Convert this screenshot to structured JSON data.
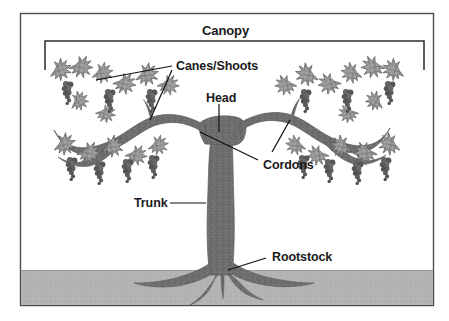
{
  "figure": {
    "colors": {
      "frame_border": "#4d4d4d",
      "background": "#ffffff",
      "ground": "#b3b3b3",
      "ground_border": "#9a9a9a",
      "wood": "#6e6e6e",
      "wood_dark": "#5a5a5a",
      "leaf_light": "#a8a8a8",
      "leaf_dark": "#6a6a6a",
      "grape": "#5f5f5f",
      "leader_line": "#111111",
      "text": "#1a1a1a"
    }
  },
  "labels": {
    "canopy": "Canopy",
    "canes_shoots": "Canes/Shoots",
    "head": "Head",
    "cordons": "Cordons",
    "trunk": "Trunk",
    "rootstock": "Rootstock"
  },
  "annotations": [
    {
      "name": "canopy",
      "text": "Canopy",
      "x": 202,
      "y": 24,
      "leader": "bracket-below"
    },
    {
      "name": "canes-shoots",
      "text": "Canes/Shoots",
      "x": 176,
      "y": 60,
      "leader": "two-lines-left"
    },
    {
      "name": "head",
      "text": "Head",
      "x": 211,
      "y": 94,
      "leader": "vertical-down"
    },
    {
      "name": "cordons",
      "text": "Cordons",
      "x": 263,
      "y": 160,
      "leader": "two-lines-up-left"
    },
    {
      "name": "trunk",
      "text": "Trunk",
      "x": 136,
      "y": 200,
      "leader": "horizontal-right"
    },
    {
      "name": "rootstock",
      "text": "Rootstock",
      "x": 272,
      "y": 253,
      "leader": "diagonal-down-left"
    }
  ],
  "parts": {
    "canopy": "Canopy",
    "canes_shoots": "Canes/Shoots",
    "head": "Head",
    "cordons": "Cordons",
    "trunk": "Trunk",
    "rootstock": "Rootstock"
  },
  "layout": {
    "frame": {
      "x": 20,
      "y": 13,
      "w": 414,
      "h": 293
    },
    "ground": {
      "y": 270,
      "h": 35
    },
    "bracket": {
      "x1": 45,
      "x2": 424,
      "y": 41,
      "tick": 29
    }
  }
}
